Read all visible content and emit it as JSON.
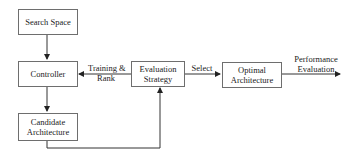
{
  "diagram": {
    "nodes": {
      "search_space": "Search Space",
      "controller": "Controller",
      "candidate_line1": "Candidate",
      "candidate_line2": "Architecture",
      "evaluation_line1": "Evaluation",
      "evaluation_line2": "Strategy",
      "optimal_line1": "Optimal",
      "optimal_line2": "Architecture"
    },
    "edges": {
      "training_line1": "Training &",
      "training_line2": "Rank",
      "select": "Select",
      "performance_line1": "Performance",
      "performance_line2": "Evaluation"
    },
    "colors": {
      "line": "#333333",
      "border": "#6e6e6e"
    }
  }
}
